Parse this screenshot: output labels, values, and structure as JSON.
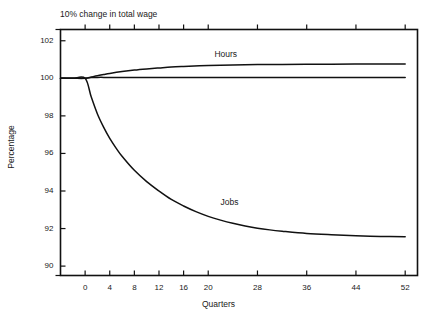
{
  "chart_data": {
    "type": "line",
    "title": "10% change in total wage",
    "xlabel": "Quarters",
    "ylabel": "Percentage",
    "xlim": [
      -4,
      54
    ],
    "ylim": [
      89.5,
      102.6
    ],
    "grid": false,
    "legend": "inline-labels",
    "yticks": [
      90,
      92,
      94,
      96,
      98,
      100,
      102
    ],
    "ytick_labels": [
      "90",
      "92",
      "94",
      "96",
      "98",
      "100",
      "102"
    ],
    "xticks": [
      0,
      4,
      8,
      12,
      16,
      20,
      28,
      36,
      44,
      52
    ],
    "xtick_labels": [
      "0",
      "4",
      "8",
      "12",
      "16",
      "20",
      "28",
      "36",
      "44",
      "52"
    ],
    "annotations": [
      {
        "text": "Hours",
        "x": 21,
        "y": 101.3
      },
      {
        "text": "Jobs",
        "x": 22,
        "y": 93.4
      }
    ],
    "series": [
      {
        "name": "Wage",
        "label": "",
        "color": "#111111",
        "x": [
          -4,
          -2,
          0,
          1,
          2,
          4,
          8,
          12,
          16,
          20,
          24,
          28,
          32,
          36,
          40,
          44,
          48,
          52
        ],
        "values": [
          100.0,
          100.0,
          100.0,
          100.04,
          100.05,
          100.05,
          100.05,
          100.05,
          100.05,
          100.05,
          100.05,
          100.05,
          100.05,
          100.05,
          100.05,
          100.05,
          100.05,
          100.05
        ]
      },
      {
        "name": "Hours",
        "label": "Hours",
        "color": "#111111",
        "x": [
          -4,
          -2,
          0,
          1,
          2,
          3,
          4,
          6,
          8,
          10,
          12,
          14,
          16,
          20,
          24,
          28,
          32,
          36,
          40,
          44,
          48,
          52
        ],
        "values": [
          100.0,
          100.0,
          100.0,
          100.07,
          100.14,
          100.2,
          100.26,
          100.36,
          100.44,
          100.5,
          100.55,
          100.6,
          100.63,
          100.68,
          100.71,
          100.73,
          100.74,
          100.75,
          100.75,
          100.76,
          100.76,
          100.76
        ]
      },
      {
        "name": "Jobs",
        "label": "Jobs",
        "color": "#111111",
        "x": [
          -4,
          -2,
          0,
          1,
          2,
          3,
          4,
          5,
          6,
          8,
          10,
          12,
          14,
          16,
          18,
          20,
          22,
          24,
          26,
          28,
          30,
          32,
          36,
          40,
          44,
          48,
          52
        ],
        "values": [
          100.0,
          100.0,
          100.0,
          99.0,
          98.1,
          97.4,
          96.8,
          96.3,
          95.85,
          95.1,
          94.5,
          94.0,
          93.55,
          93.2,
          92.9,
          92.65,
          92.45,
          92.28,
          92.14,
          92.02,
          91.93,
          91.86,
          91.74,
          91.67,
          91.62,
          91.58,
          91.56
        ]
      }
    ]
  }
}
